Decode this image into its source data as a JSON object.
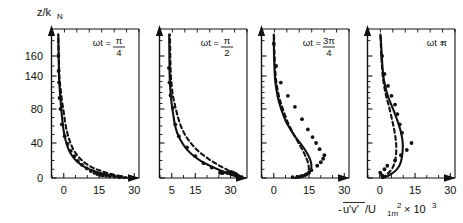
{
  "figure": {
    "y_axis_title": "z/k",
    "y_axis_title_sub": "N",
    "x_axis_title_pre": "-",
    "x_axis_title_uv": "u'v'",
    "x_axis_title_mid": "/U",
    "x_axis_title_sub": "1m",
    "x_axis_title_sup": "2",
    "x_axis_title_mult": "× 10",
    "x_axis_title_exp": "3",
    "y_ticklabels": [
      "0",
      "40",
      "80",
      "140",
      "160"
    ],
    "line_colors": {
      "solid": "#111111",
      "dashed": "#111111",
      "points": "#111111"
    }
  },
  "chart_data": {
    "type": "line",
    "title": "",
    "xlabel": "-u'v'/U_1m^2 × 10^3",
    "ylabel": "z/k_N",
    "ylim": [
      0,
      175
    ],
    "ytick_values": [
      0,
      40,
      80,
      140,
      160
    ],
    "ytick_labels": [
      "0",
      "40",
      "80",
      "140",
      "160"
    ],
    "grid": false,
    "legend": "none",
    "panels": [
      {
        "label_prefix": "ωt =",
        "label_num": "π",
        "label_den": "4",
        "xlim": [
          -5,
          32
        ],
        "xtick_values": [
          0,
          15,
          30
        ],
        "xtick_labels": [
          "0",
          "15",
          "30"
        ],
        "series": [
          {
            "name": "solid-model",
            "style": "solid",
            "x": [
              26.0,
              21.0,
              16.5,
              13.0,
              10.0,
              7.5,
              5.2,
              3.4,
              2.0,
              0.9,
              0.1,
              -0.5,
              -1.0,
              -1.3,
              -1.6,
              -1.8,
              -2.0,
              -2.1,
              -2.2,
              -2.3
            ],
            "y": [
              0.0,
              2.5,
              5.0,
              8.0,
              11.0,
              15.0,
              20.0,
              26.0,
              33.0,
              42.0,
              52.0,
              64.0,
              78.0,
              93.0,
              108.0,
              122.0,
              136.0,
              150.0,
              163.0,
              174.0
            ]
          },
          {
            "name": "dashed-model",
            "style": "dashed",
            "x": [
              27.5,
              23.5,
              19.5,
              16.0,
              13.0,
              10.2,
              7.8,
              5.7,
              4.0,
              2.6,
              1.5,
              0.6,
              -0.1,
              -0.7,
              -1.1,
              -1.5,
              -1.8,
              -2.0,
              -2.2,
              -2.4
            ],
            "y": [
              0.0,
              2.5,
              5.0,
              8.0,
              11.0,
              15.0,
              20.0,
              26.0,
              33.0,
              42.0,
              52.0,
              64.0,
              78.0,
              93.0,
              108.0,
              122.0,
              136.0,
              150.0,
              163.0,
              174.0
            ]
          },
          {
            "name": "measurements",
            "style": "points",
            "x": [
              23.5,
              21.5,
              19.5,
              18.0,
              16.5,
              15.5,
              14.2,
              13.0,
              11.5,
              9.8,
              7.8,
              6.0,
              4.5,
              3.0,
              1.6,
              0.4,
              -0.8,
              -1.4,
              -1.8,
              -2.0,
              -2.2,
              -2.3
            ],
            "y": [
              1.0,
              1.5,
              2.0,
              2.5,
              3.0,
              3.5,
              4.5,
              6.0,
              8.0,
              11.0,
              15.0,
              19.5,
              25.0,
              31.0,
              39.0,
              48.0,
              62.0,
              80.0,
              100.0,
              128.0,
              145.0,
              160.0
            ]
          }
        ]
      },
      {
        "label_prefix": "ωt =",
        "label_num": "π",
        "label_den": "2",
        "xlim": [
          0,
          37
        ],
        "xtick_values": [
          5,
          15,
          30
        ],
        "xtick_labels": [
          "5",
          "15",
          "30"
        ],
        "series": [
          {
            "name": "solid-model",
            "style": "solid",
            "x": [
              34.0,
              31.0,
              28.0,
              25.0,
              22.0,
              19.0,
              16.5,
              14.0,
              12.0,
              10.2,
              8.6,
              7.3,
              6.3,
              5.6,
              5.0,
              4.6,
              4.3,
              4.1,
              4.0,
              3.9
            ],
            "y": [
              0.0,
              3.0,
              6.0,
              9.5,
              13.0,
              17.0,
              21.0,
              26.0,
              31.0,
              37.0,
              44.0,
              52.0,
              62.0,
              74.0,
              88.0,
              104.0,
              122.0,
              141.0,
              158.0,
              174.0
            ]
          },
          {
            "name": "dashed-model",
            "style": "dashed",
            "x": [
              34.5,
              32.5,
              30.5,
              28.5,
              26.0,
              23.5,
              21.0,
              18.5,
              16.2,
              14.0,
              12.0,
              10.2,
              8.6,
              7.3,
              6.3,
              5.5,
              5.0,
              4.6,
              4.4,
              4.2
            ],
            "y": [
              0.0,
              3.0,
              6.0,
              9.5,
              13.0,
              17.0,
              21.0,
              26.0,
              31.0,
              37.0,
              44.0,
              52.0,
              62.0,
              74.0,
              88.0,
              104.0,
              122.0,
              141.0,
              158.0,
              174.0
            ]
          },
          {
            "name": "measurements",
            "style": "points",
            "x": [
              34.5,
              33.5,
              33.0,
              32.5,
              32.0,
              31.0,
              30.0,
              28.5,
              27.0,
              26.5,
              25.5,
              22.0,
              18.5,
              15.0,
              11.5,
              8.0,
              6.5,
              5.5,
              4.5,
              4.0,
              3.8
            ],
            "y": [
              1.0,
              2.0,
              3.0,
              4.0,
              5.0,
              6.5,
              7.0,
              6.0,
              6.5,
              5.5,
              6.0,
              12.0,
              17.0,
              25.0,
              35.0,
              48.0,
              62.0,
              82.0,
              105.0,
              128.0,
              148.0
            ]
          }
        ]
      },
      {
        "label_prefix": "ωt =",
        "label_num": "3π",
        "label_den": "4",
        "xlim": [
          -5,
          32
        ],
        "xtick_values": [
          0,
          15,
          30
        ],
        "xtick_labels": [
          "0",
          "15",
          "30"
        ],
        "series": [
          {
            "name": "solid-model",
            "style": "solid",
            "x": [
              9.0,
              12.5,
              14.5,
              15.6,
              16.0,
              15.9,
              15.2,
              13.8,
              11.8,
              9.5,
              7.3,
              5.4,
              3.9,
              2.7,
              1.8,
              1.1,
              0.6,
              0.3,
              0.1,
              0.0
            ],
            "y": [
              0.0,
              2.5,
              5.0,
              8.0,
              12.0,
              17.0,
              23.0,
              30.0,
              38.0,
              46.0,
              55.0,
              64.0,
              74.0,
              86.0,
              100.0,
              116.0,
              132.0,
              148.0,
              162.0,
              174.0
            ]
          },
          {
            "name": "dashed-model",
            "style": "dashed",
            "x": [
              10.5,
              13.0,
              14.3,
              14.8,
              14.9,
              14.6,
              13.8,
              12.6,
              11.0,
              9.3,
              7.6,
              6.0,
              4.6,
              3.4,
              2.4,
              1.6,
              1.0,
              0.6,
              0.3,
              0.1
            ],
            "y": [
              0.0,
              2.5,
              5.0,
              8.0,
              12.0,
              17.0,
              23.0,
              30.0,
              38.0,
              46.0,
              55.0,
              64.0,
              74.0,
              86.0,
              100.0,
              116.0,
              132.0,
              148.0,
              162.0,
              174.0
            ]
          },
          {
            "name": "measurements",
            "style": "points",
            "x": [
              8.0,
              10.0,
              11.5,
              12.5,
              13.5,
              14.0,
              15.0,
              16.0,
              18.5,
              20.0,
              21.0,
              21.5,
              19.5,
              18.0,
              16.5,
              14.5,
              12.0,
              9.0,
              6.0,
              3.0,
              1.0,
              0.0
            ],
            "y": [
              1.0,
              1.5,
              2.0,
              2.5,
              3.5,
              4.5,
              6.0,
              9.0,
              14.0,
              18.0,
              22.0,
              26.0,
              33.0,
              40.0,
              47.0,
              56.0,
              68.0,
              84.0,
              104.0,
              128.0,
              150.0,
              168.0
            ]
          }
        ]
      },
      {
        "label_prefix": "ωt =",
        "label_num": "π",
        "label_den": "",
        "xlim": [
          -5,
          32
        ],
        "xtick_values": [
          0,
          15,
          30
        ],
        "xtick_labels": [
          "0",
          "15",
          "30"
        ],
        "series": [
          {
            "name": "solid-model",
            "style": "solid",
            "x": [
              1.5,
              4.5,
              7.0,
              8.5,
              9.3,
              9.7,
              9.8,
              9.5,
              8.8,
              7.8,
              6.5,
              5.2,
              4.0,
              3.0,
              2.2,
              1.6,
              1.1,
              0.8,
              0.5,
              0.3
            ],
            "y": [
              0.0,
              4.0,
              9.0,
              15.0,
              22.0,
              30.0,
              38.0,
              46.0,
              55.0,
              64.0,
              74.0,
              85.0,
              97.0,
              110.0,
              124.0,
              138.0,
              151.0,
              162.0,
              170.0,
              174.0
            ]
          },
          {
            "name": "dashed-model",
            "style": "dashed",
            "x": [
              1.0,
              3.0,
              4.8,
              6.0,
              6.7,
              7.0,
              7.0,
              6.7,
              6.2,
              5.5,
              4.7,
              3.9,
              3.1,
              2.4,
              1.8,
              1.3,
              0.9,
              0.6,
              0.4,
              0.2
            ],
            "y": [
              0.0,
              4.0,
              9.0,
              15.0,
              22.0,
              30.0,
              38.0,
              46.0,
              55.0,
              64.0,
              74.0,
              85.0,
              97.0,
              110.0,
              124.0,
              138.0,
              151.0,
              162.0,
              170.0,
              174.0
            ]
          },
          {
            "name": "measurements",
            "style": "points",
            "x": [
              1.0,
              0.2,
              2.0,
              3.2,
              6.5,
              9.0,
              11.5,
              13.5,
              9.5,
              8.5,
              7.5,
              6.5,
              5.0,
              3.5,
              2.0,
              1.0
            ],
            "y": [
              3.0,
              6.0,
              10.0,
              14.0,
              20.0,
              26.0,
              32.0,
              40.0,
              52.0,
              62.0,
              74.0,
              88.0,
              104.0,
              122.0,
              142.0,
              160.0
            ]
          }
        ]
      }
    ]
  }
}
